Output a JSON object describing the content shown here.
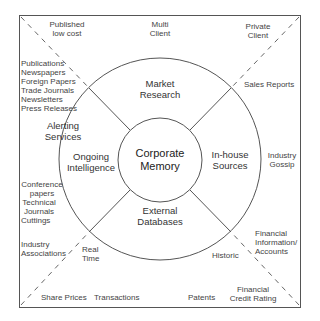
{
  "center": {
    "line1": "Corporate",
    "line2": "Memory"
  },
  "quadrants": {
    "top": {
      "line1": "Market",
      "line2": "Research"
    },
    "right": {
      "line1": "In-house",
      "line2": "Sources"
    },
    "bottom": {
      "line1": "External",
      "line2": "Databases"
    },
    "left": {
      "line1": "Ongoing",
      "line2": "Intelligence"
    }
  },
  "outer": {
    "alerting": {
      "line1": "Alerting",
      "line2": "Services"
    },
    "published": {
      "line1": "Published",
      "line2": "low cost"
    },
    "multi_client": {
      "line1": "Multi",
      "line2": "Client"
    },
    "private_client": {
      "line1": "Private",
      "line2": "Client"
    },
    "sales_reports": "Sales Reports",
    "industry_gossip": {
      "line1": "Industry",
      "line2": "Gossip"
    },
    "publications_list": [
      "Publications",
      "Newspapers",
      "Foreign Papers",
      "Trade Journals",
      "Newsletters",
      "Press Releases"
    ],
    "conference": {
      "line1": "Conference",
      "line2": "papers"
    },
    "technical": {
      "line1": "Technical",
      "line2": "Journals"
    },
    "cuttings": "Cuttings",
    "industry_assoc": {
      "line1": "Industry",
      "line2": "Associations"
    },
    "real_time": {
      "line1": "Real",
      "line2": "Time"
    },
    "historic": "Historic",
    "financial_info": {
      "line1": "Financial",
      "line2": "Information/",
      "line3": "Accounts"
    },
    "share_prices": "Share Prices",
    "transactions": "Transactions",
    "patents": "Patents",
    "credit_rating": {
      "line1": "Financial",
      "line2": "Credit Rating"
    }
  }
}
